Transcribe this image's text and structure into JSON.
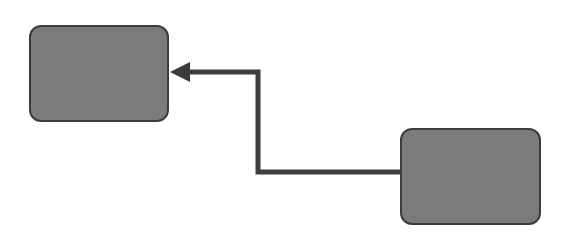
{
  "diagram": {
    "type": "flow",
    "colors": {
      "node_fill": "#7b7b7b",
      "node_stroke": "#3c3c3c",
      "edge": "#3f3f3f",
      "background": "#ffffff"
    },
    "nodes": [
      {
        "id": "A",
        "label": "",
        "x": 29,
        "y": 25,
        "w": 140,
        "h": 97
      },
      {
        "id": "B",
        "label": "",
        "x": 400,
        "y": 128,
        "w": 141,
        "h": 97
      }
    ],
    "edges": [
      {
        "from": "B",
        "to": "A",
        "style": "orthogonal",
        "arrow": "end",
        "points": [
          [
            400,
            172
          ],
          [
            258,
            172
          ],
          [
            258,
            72
          ],
          [
            170,
            72
          ]
        ]
      }
    ]
  }
}
